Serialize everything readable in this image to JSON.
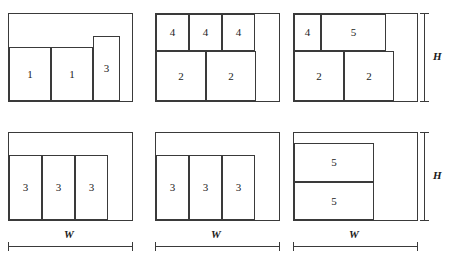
{
  "figure": {
    "type": "bin-packing-layout-diagram",
    "container_width_label": "W",
    "container_height_label": "H",
    "line_color": "#3a3a3a",
    "background_color": "#ffffff",
    "text_color": "#1b1b1b"
  },
  "panels": [
    {
      "id": "panel-1",
      "row": 1,
      "column": 1,
      "frame": {
        "x": 8,
        "y": 13,
        "w": 125,
        "h": 89
      },
      "items": [
        {
          "label": "1",
          "x": 9,
          "y": 47,
          "w": 42,
          "h": 54
        },
        {
          "label": "1",
          "x": 51,
          "y": 47,
          "w": 42,
          "h": 54
        },
        {
          "label": "3",
          "x": 93,
          "y": 36,
          "w": 27,
          "h": 65
        }
      ],
      "has_height_bracket": false,
      "has_width_bracket": false
    },
    {
      "id": "panel-2",
      "row": 1,
      "column": 2,
      "frame": {
        "x": 155,
        "y": 13,
        "w": 125,
        "h": 89
      },
      "items": [
        {
          "label": "4",
          "x": 156,
          "y": 14,
          "w": 33,
          "h": 37
        },
        {
          "label": "4",
          "x": 189,
          "y": 14,
          "w": 33,
          "h": 37
        },
        {
          "label": "4",
          "x": 222,
          "y": 14,
          "w": 33,
          "h": 37
        },
        {
          "label": "2",
          "x": 156,
          "y": 51,
          "w": 50,
          "h": 50
        },
        {
          "label": "2",
          "x": 206,
          "y": 51,
          "w": 50,
          "h": 50
        }
      ],
      "has_height_bracket": false,
      "has_width_bracket": false
    },
    {
      "id": "panel-3",
      "row": 1,
      "column": 3,
      "frame": {
        "x": 293,
        "y": 13,
        "w": 125,
        "h": 89
      },
      "items": [
        {
          "label": "4",
          "x": 294,
          "y": 14,
          "w": 27,
          "h": 37
        },
        {
          "label": "5",
          "x": 321,
          "y": 14,
          "w": 65,
          "h": 37
        },
        {
          "label": "2",
          "x": 294,
          "y": 51,
          "w": 50,
          "h": 50
        },
        {
          "label": "2",
          "x": 344,
          "y": 51,
          "w": 50,
          "h": 50
        }
      ],
      "has_height_bracket": true,
      "has_width_bracket": false
    },
    {
      "id": "panel-4",
      "row": 2,
      "column": 1,
      "frame": {
        "x": 8,
        "y": 132,
        "w": 125,
        "h": 89
      },
      "items": [
        {
          "label": "3",
          "x": 9,
          "y": 155,
          "w": 33,
          "h": 65
        },
        {
          "label": "3",
          "x": 42,
          "y": 155,
          "w": 33,
          "h": 65
        },
        {
          "label": "3",
          "x": 75,
          "y": 155,
          "w": 33,
          "h": 65
        }
      ],
      "has_height_bracket": false,
      "has_width_bracket": true
    },
    {
      "id": "panel-5",
      "row": 2,
      "column": 2,
      "frame": {
        "x": 155,
        "y": 132,
        "w": 125,
        "h": 89
      },
      "items": [
        {
          "label": "3",
          "x": 156,
          "y": 155,
          "w": 33,
          "h": 65
        },
        {
          "label": "3",
          "x": 189,
          "y": 155,
          "w": 33,
          "h": 65
        },
        {
          "label": "3",
          "x": 222,
          "y": 155,
          "w": 33,
          "h": 65
        }
      ],
      "has_height_bracket": false,
      "has_width_bracket": true
    },
    {
      "id": "panel-6",
      "row": 2,
      "column": 3,
      "frame": {
        "x": 293,
        "y": 132,
        "w": 125,
        "h": 89
      },
      "items": [
        {
          "label": "5",
          "x": 294,
          "y": 143,
          "w": 80,
          "h": 39
        },
        {
          "label": "5",
          "x": 294,
          "y": 182,
          "w": 80,
          "h": 38
        }
      ],
      "has_height_bracket": true,
      "has_width_bracket": true
    }
  ],
  "brackets": {
    "height_top": {
      "label": "H",
      "x": 420,
      "y": 13,
      "height": 89,
      "label_x": 433,
      "label_y": 51
    },
    "height_bottom": {
      "label": "H",
      "x": 420,
      "y": 132,
      "height": 89,
      "label_x": 433,
      "label_y": 170
    },
    "width_left": {
      "label": "W",
      "x": 8,
      "y": 242,
      "width": 125,
      "label_x": 64,
      "label_y": 229
    },
    "width_middle": {
      "label": "W",
      "x": 155,
      "y": 242,
      "width": 125,
      "label_x": 211,
      "label_y": 229
    },
    "width_right": {
      "label": "W",
      "x": 293,
      "y": 242,
      "width": 125,
      "label_x": 349,
      "label_y": 229
    }
  }
}
